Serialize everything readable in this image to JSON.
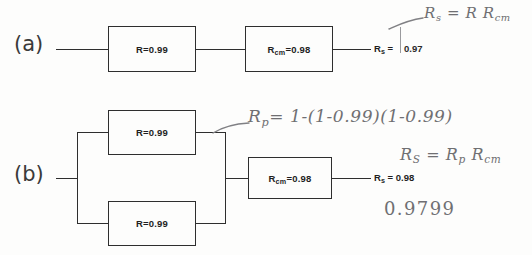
{
  "figure": {
    "type": "reliability-block-diagram",
    "background_color": "#fdfdfc",
    "ink_color": "#2e2e2e",
    "pencil_color": "#6f6f72"
  },
  "rows": [
    {
      "id": "a",
      "label": "(a)",
      "topology": "series",
      "blocks": [
        {
          "name": "R",
          "text": "R=0.99",
          "value": 0.99
        },
        {
          "name": "Rcm",
          "text_main": "R",
          "text_sub": "cm",
          "text_tail": "=0.98",
          "value": 0.98
        }
      ],
      "output": {
        "symbol": "R",
        "subscript": "s",
        "equals": "=",
        "value": "0.97"
      },
      "annotations": [
        {
          "id": "a-formula",
          "text": "R",
          "sub": "s",
          "rest": " = R R",
          "rest_sub": "cm"
        }
      ]
    },
    {
      "id": "b",
      "label": "(b)",
      "topology": "parallel-then-series",
      "blocks": [
        {
          "name": "R-top",
          "text": "R=0.99",
          "value": 0.99
        },
        {
          "name": "R-bottom",
          "text": "R=0.99",
          "value": 0.99
        },
        {
          "name": "Rcm",
          "text_main": "R",
          "text_sub": "cm",
          "text_tail": "=0.98",
          "value": 0.98
        }
      ],
      "output": {
        "symbol": "R",
        "subscript": "s",
        "equals": "=",
        "value": "0.98"
      },
      "annotations": [
        {
          "id": "b-rp-formula",
          "text": "R",
          "sub": "p",
          "rest": "= 1-(1-0.99)(1-0.99)"
        },
        {
          "id": "b-rs-formula",
          "text": "R",
          "sub": "S",
          "rest": " = R",
          "rest_sub": "p",
          "rest2": " R",
          "rest2_sub": "cm"
        },
        {
          "id": "b-result",
          "text": "0.9799"
        }
      ]
    }
  ],
  "printed_text": {
    "row_a_label": "(a)",
    "row_b_label": "(b)",
    "block_r_099": "R=0.99",
    "block_rcm_sym": "R",
    "block_rcm_sub": "cm",
    "block_rcm_val": "=0.98",
    "out_sym": "R",
    "out_sub": "s",
    "out_eq_a": "=",
    "out_val_a": "0.97",
    "out_eq_b": "= 0.98"
  },
  "handwriting": {
    "a_formula_sym": "R",
    "a_formula_sub": "s",
    "a_formula_rest": "= R R",
    "a_formula_rest_sub": "cm",
    "b_rp_sym": "R",
    "b_rp_sub": "p",
    "b_rp_rest": "= 1-(1-0.99)(1-0.99)",
    "b_rs_sym": "R",
    "b_rs_sub": "S",
    "b_rs_mid": " = R",
    "b_rs_mid_sub": "p",
    "b_rs_end": " R",
    "b_rs_end_sub": "cm",
    "b_result": "0.9799",
    "a_val_overwrite": "0.97"
  }
}
